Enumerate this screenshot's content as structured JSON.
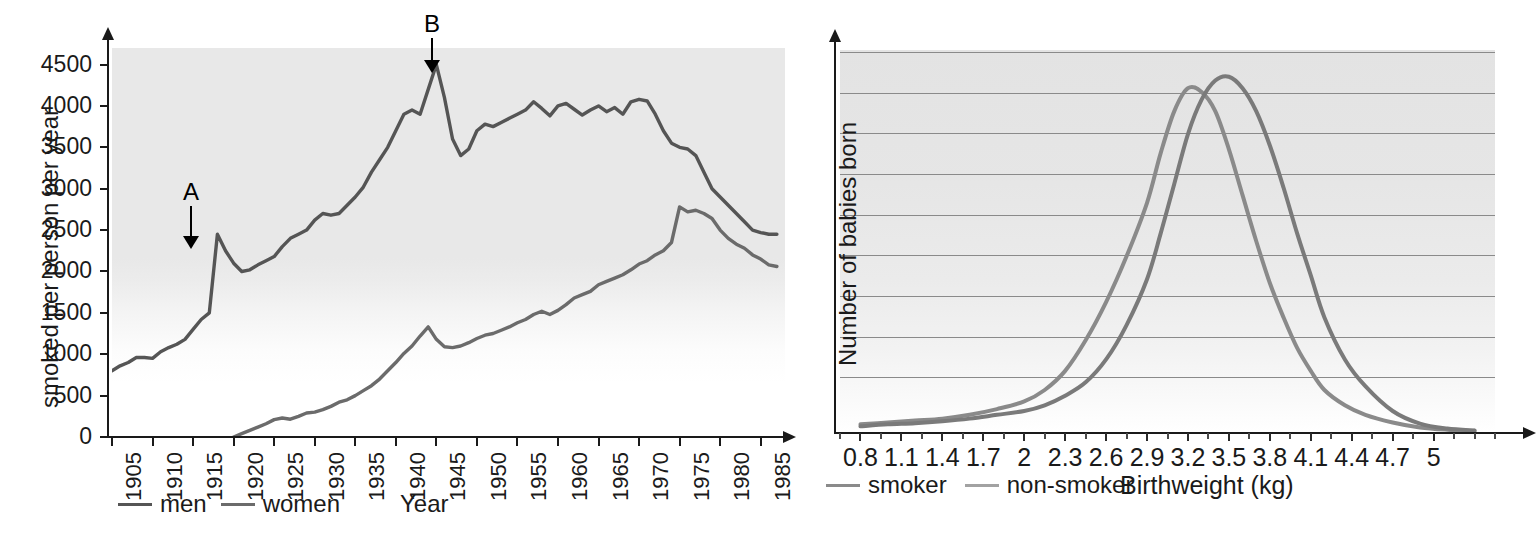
{
  "chart_data": [
    {
      "id": "cigarette-consumption",
      "type": "line",
      "title": "",
      "xlabel": "Year",
      "ylabel": "smoked per person per year",
      "xlim": [
        1905,
        1988
      ],
      "ylim": [
        0,
        4700
      ],
      "yticks": [
        0,
        500,
        1000,
        1500,
        2000,
        2500,
        3000,
        3500,
        4000,
        4500
      ],
      "xticks": [
        1905,
        1910,
        1915,
        1920,
        1925,
        1930,
        1935,
        1940,
        1945,
        1950,
        1955,
        1960,
        1965,
        1970,
        1975,
        1980,
        1985
      ],
      "grid": false,
      "legend_position": "bottom-left",
      "annotations": [
        {
          "label": "A",
          "x": 1918,
          "y": 2450,
          "note": "arrow pointing to peak at 1918"
        },
        {
          "label": "B",
          "x": 1945,
          "y": 4500,
          "note": "arrow pointing to peak at 1945"
        }
      ],
      "series": [
        {
          "name": "men",
          "color": "#555555",
          "x": [
            1905,
            1906,
            1907,
            1908,
            1909,
            1910,
            1911,
            1912,
            1913,
            1914,
            1915,
            1916,
            1917,
            1918,
            1919,
            1920,
            1921,
            1922,
            1923,
            1924,
            1925,
            1926,
            1927,
            1928,
            1929,
            1930,
            1931,
            1932,
            1933,
            1934,
            1935,
            1936,
            1937,
            1938,
            1939,
            1940,
            1941,
            1942,
            1943,
            1944,
            1945,
            1946,
            1947,
            1948,
            1949,
            1950,
            1951,
            1952,
            1953,
            1954,
            1955,
            1956,
            1957,
            1958,
            1959,
            1960,
            1961,
            1962,
            1963,
            1964,
            1965,
            1966,
            1967,
            1968,
            1969,
            1970,
            1971,
            1972,
            1973,
            1974,
            1975,
            1976,
            1977,
            1978,
            1979,
            1980,
            1981,
            1982,
            1983,
            1984,
            1985,
            1986,
            1987
          ],
          "y": [
            800,
            860,
            900,
            960,
            960,
            950,
            1030,
            1080,
            1120,
            1180,
            1300,
            1420,
            1500,
            2450,
            2250,
            2100,
            2000,
            2020,
            2080,
            2130,
            2180,
            2300,
            2400,
            2450,
            2500,
            2620,
            2700,
            2680,
            2700,
            2800,
            2900,
            3020,
            3200,
            3350,
            3500,
            3700,
            3900,
            3950,
            3900,
            4200,
            4500,
            4100,
            3600,
            3400,
            3480,
            3700,
            3780,
            3750,
            3800,
            3850,
            3900,
            3950,
            4050,
            3970,
            3880,
            4000,
            4030,
            3960,
            3890,
            3950,
            4000,
            3930,
            3980,
            3900,
            4050,
            4080,
            4060,
            3900,
            3700,
            3550,
            3500,
            3480,
            3400,
            3200,
            3000,
            2900,
            2800,
            2700,
            2600,
            2500,
            2470,
            2450,
            2450
          ]
        },
        {
          "name": "women",
          "color": "#6b6b6b",
          "x": [
            1920,
            1921,
            1922,
            1923,
            1924,
            1925,
            1926,
            1927,
            1928,
            1929,
            1930,
            1931,
            1932,
            1933,
            1934,
            1935,
            1936,
            1937,
            1938,
            1939,
            1940,
            1941,
            1942,
            1943,
            1944,
            1945,
            1946,
            1947,
            1948,
            1949,
            1950,
            1951,
            1952,
            1953,
            1954,
            1955,
            1956,
            1957,
            1958,
            1959,
            1960,
            1961,
            1962,
            1963,
            1964,
            1965,
            1966,
            1967,
            1968,
            1969,
            1970,
            1971,
            1972,
            1973,
            1974,
            1975,
            1976,
            1977,
            1978,
            1979,
            1980,
            1981,
            1982,
            1983,
            1984,
            1985,
            1986,
            1987
          ],
          "y": [
            0,
            40,
            80,
            120,
            160,
            210,
            230,
            215,
            250,
            290,
            300,
            330,
            370,
            420,
            450,
            500,
            560,
            620,
            700,
            800,
            900,
            1010,
            1100,
            1220,
            1330,
            1180,
            1090,
            1080,
            1100,
            1140,
            1190,
            1230,
            1250,
            1290,
            1330,
            1380,
            1420,
            1480,
            1520,
            1480,
            1530,
            1600,
            1680,
            1720,
            1760,
            1840,
            1880,
            1920,
            1960,
            2020,
            2090,
            2130,
            2200,
            2250,
            2350,
            2780,
            2720,
            2740,
            2700,
            2640,
            2500,
            2400,
            2330,
            2280,
            2200,
            2150,
            2080,
            2060
          ]
        }
      ]
    },
    {
      "id": "birthweight-distribution",
      "type": "line",
      "title": "",
      "xlabel": "Birthweight (kg)",
      "ylabel": "Number of babies born",
      "xticks": [
        0.8,
        1.1,
        1.4,
        1.7,
        2,
        2.3,
        2.6,
        2.9,
        3.2,
        3.5,
        3.8,
        4.1,
        4.4,
        4.7,
        5
      ],
      "xtick_labels": [
        "0.8",
        "1.1",
        "1.4",
        "1.7",
        "2",
        "2.3",
        "2.6",
        "2.9",
        "3.2",
        "3.5",
        "3.8",
        "4.1",
        "4.4",
        "4.7",
        "5"
      ],
      "xlim": [
        0.65,
        5.45
      ],
      "ylim": [
        0,
        100
      ],
      "grid": true,
      "gridlines": 9,
      "legend_position": "bottom-left",
      "series": [
        {
          "name": "smoker",
          "color": "#808080",
          "x": [
            0.8,
            1.0,
            1.2,
            1.4,
            1.6,
            1.8,
            2.0,
            2.15,
            2.3,
            2.45,
            2.6,
            2.75,
            2.9,
            3.0,
            3.1,
            3.2,
            3.3,
            3.4,
            3.5,
            3.6,
            3.7,
            3.8,
            3.9,
            4.0,
            4.1,
            4.2,
            4.35,
            4.5,
            4.7,
            4.9,
            5.1,
            5.3
          ],
          "y": [
            2,
            2.5,
            3,
            3.5,
            4.5,
            6,
            8,
            11,
            16,
            24,
            34,
            46,
            60,
            73,
            84,
            90,
            89,
            84,
            74,
            62,
            50,
            39,
            30,
            22,
            16,
            11,
            7,
            4.5,
            2.5,
            1.2,
            0.6,
            0.3
          ]
        },
        {
          "name": "non-smoker",
          "color": "#777777",
          "x": [
            0.8,
            1.0,
            1.2,
            1.4,
            1.6,
            1.8,
            2.0,
            2.15,
            2.3,
            2.45,
            2.6,
            2.75,
            2.9,
            3.0,
            3.1,
            3.2,
            3.3,
            3.4,
            3.5,
            3.6,
            3.7,
            3.8,
            3.9,
            4.0,
            4.1,
            4.2,
            4.35,
            4.5,
            4.7,
            4.9,
            5.1,
            5.3
          ],
          "y": [
            1.5,
            2,
            2.3,
            2.8,
            3.5,
            4.5,
            5.5,
            7,
            9.5,
            13,
            19,
            28,
            40,
            52,
            65,
            78,
            87,
            92,
            93,
            90,
            84,
            75,
            64,
            52,
            41,
            30,
            19,
            12,
            5.5,
            2.2,
            0.9,
            0.4
          ]
        }
      ]
    }
  ],
  "left": {
    "ylabel": "smoked per person per year",
    "xlabel": "Year",
    "ytick_labels": [
      "4500",
      "4000",
      "3500",
      "3000",
      "2500",
      "2000",
      "1500",
      "1000",
      "500",
      "0"
    ],
    "xtick_labels": [
      "1905",
      "1910",
      "1915",
      "1920",
      "1925",
      "1930",
      "1935",
      "1940",
      "1945",
      "1950",
      "1955",
      "1960",
      "1965",
      "1970",
      "1975",
      "1980",
      "1985"
    ],
    "annotations": [
      {
        "label": "A"
      },
      {
        "label": "B"
      }
    ],
    "legend": [
      {
        "label": "men",
        "color": "#555555"
      },
      {
        "label": "women",
        "color": "#6b6b6b"
      }
    ]
  },
  "right": {
    "ylabel": "Number of babies born",
    "xlabel": "Birthweight (kg)",
    "xtick_labels": [
      "0.8",
      "1.1",
      "1.4",
      "1.7",
      "2",
      "2.3",
      "2.6",
      "2.9",
      "3.2",
      "3.5",
      "3.8",
      "4.1",
      "4.4",
      "4.7",
      "5"
    ],
    "legend": [
      {
        "label": "smoker",
        "color": "#808080"
      },
      {
        "label": "non-smoker",
        "color": "#9a9a9a"
      }
    ]
  }
}
